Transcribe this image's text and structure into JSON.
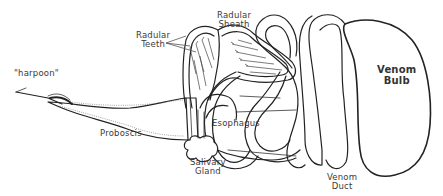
{
  "diagram": {
    "labels": {
      "harpoon": "\"harpoon\"",
      "radular_teeth": "Radular\nTeeth",
      "radular_sheath": "Radular\nSheath",
      "venom_bulb": "Venom\nBulb",
      "proboscis": "Proboscis",
      "esophagus": "Esophagus",
      "salivary_gland": "Salivary\nGland",
      "venom_duct": "Venom\nDuct"
    },
    "colors": {
      "outline": "#222222",
      "label_text": "#3a3a3a",
      "background": "#ffffff"
    }
  }
}
